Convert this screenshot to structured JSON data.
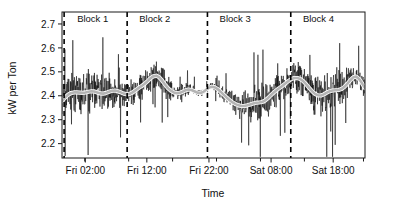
{
  "chart_data": {
    "type": "line",
    "title": "",
    "xlabel": "Time",
    "ylabel": "kW per Ton",
    "ylim": [
      2.14,
      2.75
    ],
    "xlim": [
      0,
      100
    ],
    "grid": false,
    "legend": "none",
    "y_ticks": [
      2.2,
      2.3,
      2.4,
      2.5,
      2.6,
      2.7
    ],
    "y_tick_labels": [
      "2.2",
      "2.3",
      "2.4",
      "2.5",
      "2.6",
      "2.7"
    ],
    "x_ticks": [
      7.5,
      22.0,
      36.5,
      51.0,
      65.5,
      80.0,
      99.5
    ],
    "x_tick_labels": [
      "",
      "Fri 02:00",
      "",
      "Fri 12:00",
      "",
      "Fri 22:00",
      ""
    ],
    "x_tick_labeled": [
      {
        "pos": 7.7,
        "label": "Fri 02:00"
      },
      {
        "pos": 28.0,
        "label": "Fri 12:00"
      },
      {
        "pos": 48.5,
        "label": "Fri 22:00"
      },
      {
        "pos": 69.0,
        "label": "Sat 08:00"
      },
      {
        "pos": 89.5,
        "label": "Sat 18:00"
      }
    ],
    "annotations": [
      {
        "name": "block-1",
        "label": "Block 1",
        "divider_pos": 0.7,
        "label_pos": 5.0
      },
      {
        "name": "block-2",
        "label": "Block 2",
        "divider_pos": 21.5,
        "label_pos": 25.5
      },
      {
        "name": "block-3",
        "label": "Block 3",
        "divider_pos": 48.0,
        "label_pos": 52.0
      },
      {
        "name": "block-4",
        "label": "Block 4",
        "divider_pos": 75.5,
        "label_pos": 79.5
      }
    ],
    "series": [
      {
        "name": "kW per Ton (raw)",
        "color": "#0a0a0a",
        "style": "noisy-line",
        "values": [
          2.38,
          2.32,
          2.45,
          2.29,
          2.5,
          2.34,
          2.41,
          2.27,
          2.47,
          2.36,
          2.43,
          2.31,
          2.52,
          2.38,
          2.44,
          2.3,
          2.48,
          2.35,
          2.42,
          2.33,
          2.46,
          2.28,
          2.51,
          2.37,
          2.43,
          2.32,
          2.49,
          2.34,
          2.45,
          2.3,
          2.53,
          2.39,
          2.42,
          2.31,
          2.47,
          2.36,
          2.44,
          2.29,
          2.5,
          2.35,
          2.41,
          2.33,
          2.48,
          2.27,
          2.46,
          2.38,
          2.43,
          2.32,
          2.52,
          2.34,
          2.4,
          2.3,
          2.47,
          2.37,
          2.44,
          2.31,
          2.49,
          2.35,
          2.42,
          2.28,
          2.51,
          2.39,
          2.45,
          2.33,
          2.48,
          2.3,
          2.43,
          2.36,
          2.55,
          2.32,
          2.41,
          2.29,
          2.5,
          2.38,
          2.44,
          2.34,
          2.47,
          2.31,
          2.53,
          2.35,
          2.42,
          2.27,
          2.49,
          2.37,
          2.45,
          2.33,
          2.46,
          2.3,
          2.52,
          2.36,
          2.43,
          2.28,
          2.48,
          2.34,
          2.41,
          2.32,
          2.5,
          2.38,
          2.44,
          2.29
        ]
      },
      {
        "name": "kW per Ton (smoothed)",
        "color": "#b4b4b4",
        "style": "smooth-line",
        "values": [
          2.378,
          2.392,
          2.404,
          2.411,
          2.414,
          2.414,
          2.413,
          2.412,
          2.414,
          2.417,
          2.419,
          2.418,
          2.414,
          2.41,
          2.409,
          2.412,
          2.417,
          2.421,
          2.422,
          2.419,
          2.414,
          2.409,
          2.406,
          2.408,
          2.414,
          2.423,
          2.432,
          2.44,
          2.449,
          2.46,
          2.472,
          2.481,
          2.484,
          2.478,
          2.464,
          2.447,
          2.432,
          2.421,
          2.414,
          2.411,
          2.412,
          2.417,
          2.423,
          2.426,
          2.424,
          2.419,
          2.413,
          2.412,
          2.416,
          2.425,
          2.434,
          2.438,
          2.435,
          2.427,
          2.416,
          2.404,
          2.392,
          2.381,
          2.372,
          2.365,
          2.36,
          2.357,
          2.357,
          2.36,
          2.364,
          2.368,
          2.371,
          2.372,
          2.374,
          2.38,
          2.39,
          2.402,
          2.414,
          2.424,
          2.433,
          2.442,
          2.452,
          2.462,
          2.47,
          2.474,
          2.474,
          2.47,
          2.461,
          2.448,
          2.433,
          2.419,
          2.408,
          2.402,
          2.401,
          2.406,
          2.413,
          2.419,
          2.422,
          2.423,
          2.424,
          2.428,
          2.437,
          2.45,
          2.465,
          2.477,
          2.48,
          2.47,
          2.452,
          2.432
        ]
      }
    ]
  },
  "figure": {
    "background": "#ffffff",
    "axis_color": "#1a1a1a",
    "raw_color": "#0a0a0a",
    "smooth_color": "#b4b4b4"
  }
}
